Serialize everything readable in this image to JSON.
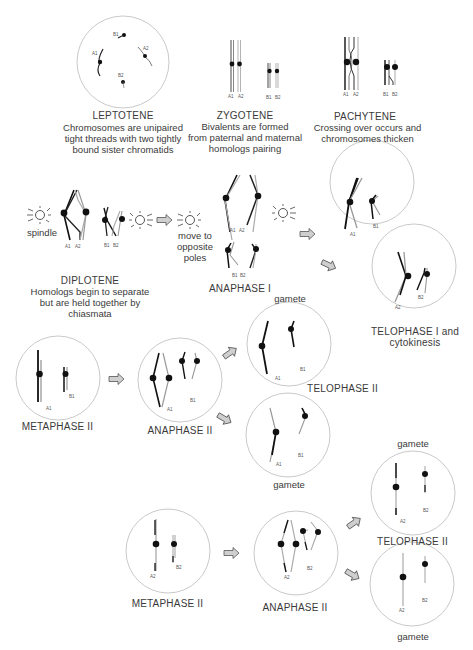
{
  "figure": {
    "type": "meiosis-stages-diagram",
    "stages": {
      "leptotene": {
        "title": "LEPTOTENE",
        "desc": [
          "Chromosomes are unipaired",
          "tight threads with two tightly",
          "bound sister chromatids"
        ],
        "labels": [
          "A1",
          "A2",
          "B1",
          "B2"
        ]
      },
      "zygotene": {
        "title": "ZYGOTENE",
        "desc": [
          "Bivalents are formed",
          "from paternal and maternal",
          "homologs pairing"
        ],
        "labels": [
          "A1",
          "A2",
          "B1",
          "B2"
        ]
      },
      "pachytene": {
        "title": "PACHYTENE",
        "desc": [
          "Crossing over occurs and",
          "chromosomes thicken"
        ],
        "labels": [
          "A1",
          "A2",
          "B1",
          "B2"
        ]
      },
      "diplotene": {
        "title": "DIPLOTENE",
        "desc": [
          "Homologs begin to separate",
          "but are held together by",
          "chiasmata"
        ],
        "spindle_label": "spindle",
        "labels": [
          "A1",
          "A2",
          "B1",
          "B2"
        ]
      },
      "anaphase_1": {
        "title": "ANAPHASE I",
        "move_label": [
          "move to",
          "opposite",
          "poles"
        ],
        "labels": [
          "A1",
          "A2",
          "B1",
          "B2"
        ]
      },
      "telophase_1": {
        "title": [
          "TELOPHASE I and",
          "cytokinesis"
        ],
        "cells": [
          {
            "labels": [
              "A1",
              "B1"
            ]
          },
          {
            "labels": [
              "A2",
              "B2"
            ]
          }
        ]
      },
      "metaphase_2_top": {
        "title": "METAPHASE II",
        "labels": [
          "A1",
          "B1"
        ]
      },
      "anaphase_2_top": {
        "title": "ANAPHASE II",
        "labels": [
          "A1",
          "B1"
        ]
      },
      "telophase_2_top": {
        "title": "TELOPHASE II",
        "gamete_label_1": "gamete",
        "gamete_label_2": "gamete",
        "labels": [
          "A1",
          "B1"
        ]
      },
      "metaphase_2_bottom": {
        "title": "METAPHASE II",
        "labels": [
          "A2",
          "B2"
        ]
      },
      "anaphase_2_bottom": {
        "title": "ANAPHASE II",
        "labels": [
          "A2",
          "B2"
        ]
      },
      "telophase_2_bottom": {
        "title": "TELOPHASE II",
        "gamete_label_1": "gamete",
        "gamete_label_2": "gamete",
        "labels": [
          "A2",
          "B2"
        ]
      }
    },
    "colors": {
      "chromosome_dark": "#1a1a1a",
      "chromosome_light": "#aaaaaa",
      "circle": "#bbbbbb",
      "arrow_fill": "#cccccc",
      "arrow_stroke": "#555555",
      "text": "#3a3a3a"
    }
  }
}
